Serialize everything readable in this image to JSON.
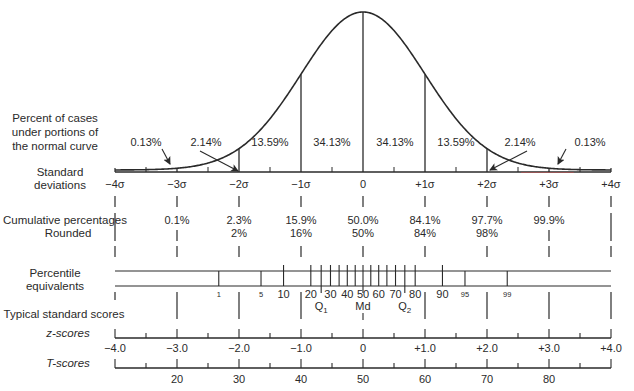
{
  "chart_data": {
    "type": "area",
    "curve": "standard normal density",
    "x_range_sigma": [
      -4,
      4
    ],
    "row_labels": {
      "percent_cases": [
        "Percent of cases",
        "under portions of",
        "the normal curve"
      ],
      "std_dev": [
        "Standard",
        "deviations"
      ],
      "cumulative": "Cumulative percentages",
      "rounded": "Rounded",
      "percentile": [
        "Percentile",
        "equivalents"
      ],
      "typical": "Typical standard scores",
      "z": "z-scores",
      "t": "T-scores"
    },
    "segment_percentages": [
      {
        "from": -4,
        "to": -3,
        "label": "0.13%"
      },
      {
        "from": -3,
        "to": -2,
        "label": "2.14%"
      },
      {
        "from": -2,
        "to": -1,
        "label": "13.59%"
      },
      {
        "from": -1,
        "to": 0,
        "label": "34.13%"
      },
      {
        "from": 0,
        "to": 1,
        "label": "34.13%"
      },
      {
        "from": 1,
        "to": 2,
        "label": "13.59%"
      },
      {
        "from": 2,
        "to": 3,
        "label": "2.14%"
      },
      {
        "from": 3,
        "to": 4,
        "label": "0.13%"
      }
    ],
    "sigma_labels": [
      "−4σ",
      "−3σ",
      "−2σ",
      "−1σ",
      "0",
      "+1σ",
      "+2σ",
      "+3σ",
      "+4σ"
    ],
    "cumulative_percentages": [
      "",
      "0.1%",
      "2.3%",
      "15.9%",
      "50.0%",
      "84.1%",
      "97.7%",
      "99.9%",
      ""
    ],
    "rounded": [
      "",
      "",
      "2%",
      "16%",
      "50%",
      "84%",
      "98%",
      "",
      ""
    ],
    "percentile_ticks": [
      1,
      5,
      10,
      20,
      25,
      30,
      35,
      40,
      45,
      50,
      55,
      60,
      65,
      70,
      75,
      80,
      90,
      95,
      99
    ],
    "percentile_labels": [
      {
        "p": 1,
        "label": "1",
        "small": true
      },
      {
        "p": 5,
        "label": "5",
        "small": true
      },
      {
        "p": 10,
        "label": "10"
      },
      {
        "p": 20,
        "label": "20"
      },
      {
        "p": 30,
        "label": "30"
      },
      {
        "p": 40,
        "label": "40"
      },
      {
        "p": 50,
        "label": "50"
      },
      {
        "p": 60,
        "label": "60"
      },
      {
        "p": 70,
        "label": "70"
      },
      {
        "p": 80,
        "label": "80"
      },
      {
        "p": 90,
        "label": "90"
      },
      {
        "p": 95,
        "label": "95",
        "small": true
      },
      {
        "p": 99,
        "label": "99",
        "small": true
      }
    ],
    "quartile_labels": [
      {
        "p": 25,
        "label": "Q",
        "sub": "1"
      },
      {
        "p": 50,
        "label": "Md",
        "sub": ""
      },
      {
        "p": 75,
        "label": "Q",
        "sub": "2"
      }
    ],
    "z_scores": [
      "−4.0",
      "−3.0",
      "−2.0",
      "−1.0",
      "0",
      "+1.0",
      "+2.0",
      "+3.0",
      "+4.0"
    ],
    "t_scores": [
      "",
      "20",
      "30",
      "40",
      "50",
      "60",
      "70",
      "80",
      ""
    ]
  }
}
